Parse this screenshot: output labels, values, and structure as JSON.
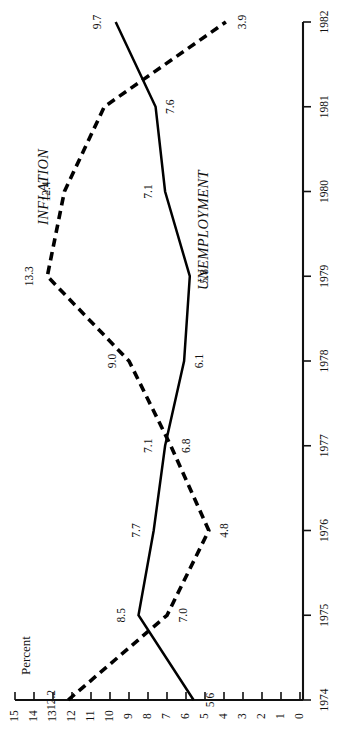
{
  "chart_data": {
    "type": "line",
    "title": "",
    "orientation": "rotated-90-sideways",
    "xlabel": "",
    "ylabel": "Percent",
    "x": [
      1974,
      1975,
      1976,
      1977,
      1978,
      1979,
      1980,
      1981,
      1982
    ],
    "xtick_labels": [
      "1974",
      "1975",
      "1976",
      "1977",
      "1978",
      "1979",
      "1980",
      "1981",
      "1982"
    ],
    "ytick_labels": [
      "0",
      "1",
      "2",
      "3",
      "4",
      "5",
      "6",
      "7",
      "8",
      "9",
      "10",
      "11",
      "12",
      "13",
      "14",
      "15"
    ],
    "ytick_values": [
      0,
      1,
      2,
      3,
      4,
      5,
      6,
      7,
      8,
      9,
      10,
      11,
      12,
      13,
      14,
      15
    ],
    "ylim": [
      0,
      15
    ],
    "xlim": [
      1974,
      1982
    ],
    "grid": false,
    "legend_position": "inline-annotations",
    "series": [
      {
        "name": "UNEMPLOYMENT",
        "style": "solid",
        "color": "#000000",
        "values": [
          5.6,
          8.5,
          7.7,
          7.1,
          6.1,
          5.8,
          7.1,
          7.6,
          9.7
        ],
        "point_labels": [
          "5.6",
          "8.5",
          "7.7",
          "7.1",
          "6.1",
          "5.8",
          "7.1",
          "7.6",
          "9.7"
        ]
      },
      {
        "name": "INFLATION",
        "style": "dashed",
        "color": "#000000",
        "values": [
          12.2,
          7.0,
          4.8,
          6.8,
          9.0,
          13.3,
          12.4,
          10.3,
          3.9
        ],
        "point_labels": [
          "12.2",
          "7.0",
          "4.8",
          "6.8",
          "9.0",
          "13.3",
          "12.4",
          "",
          "3.9"
        ]
      }
    ]
  },
  "annotations": {
    "inflation_label": "INFLATION",
    "unemployment_label": "UNEMPLOYMENT",
    "percent_label": "Percent"
  }
}
